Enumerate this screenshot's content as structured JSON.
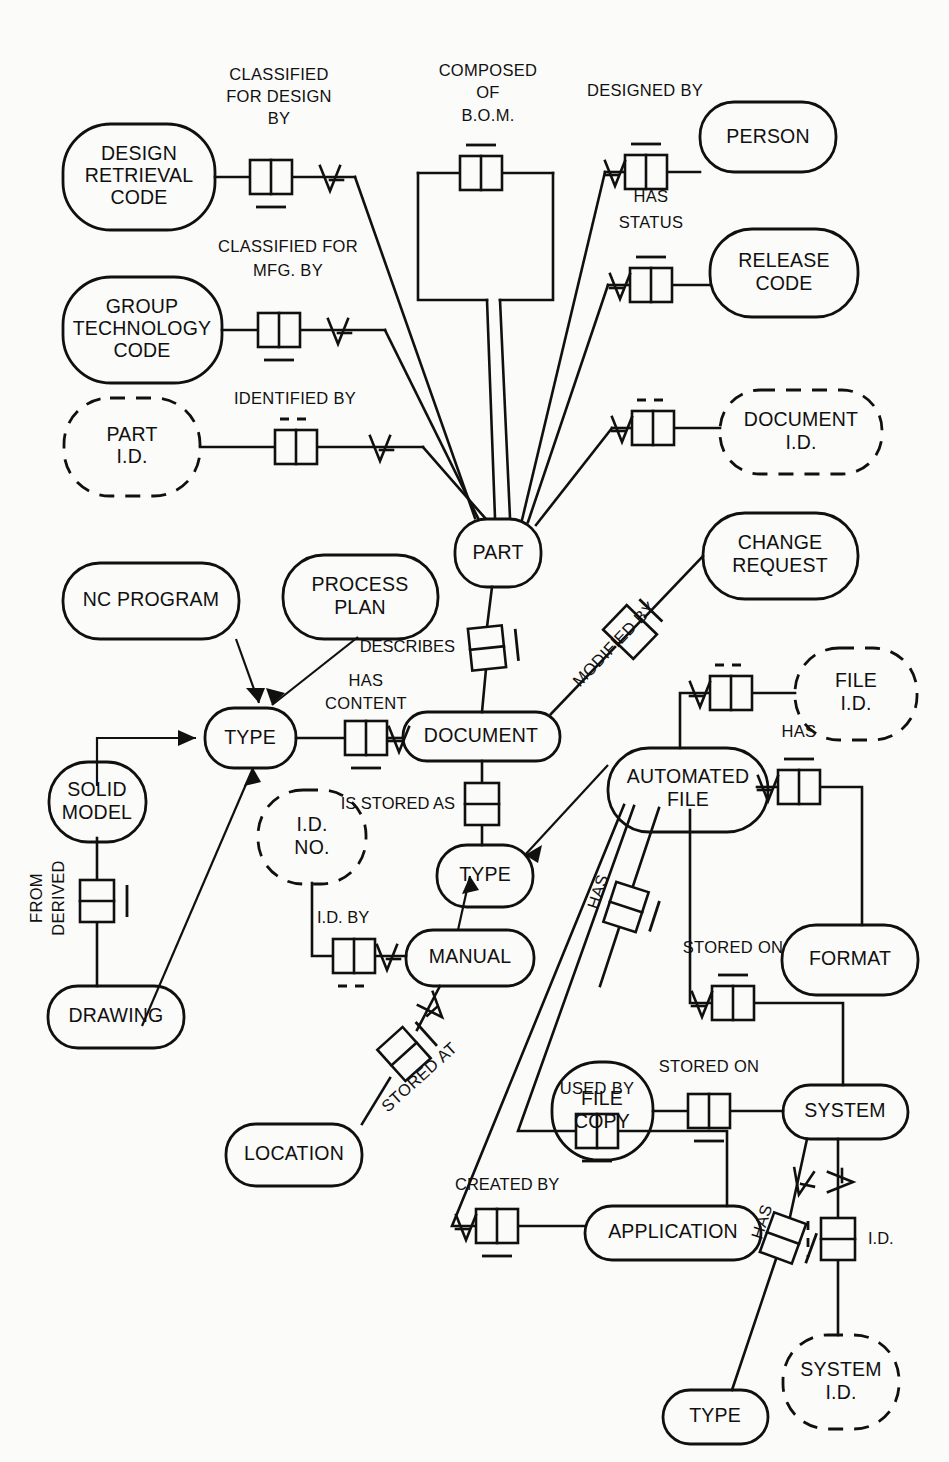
{
  "diagram": {
    "type": "entity-relationship",
    "notation": "IDEF1X-style information model",
    "background_color": "#fbfbf9",
    "line_color": "#101010"
  },
  "entities": [
    {
      "id": "design_retrieval_code",
      "label_lines": [
        "DESIGN",
        "RETRIEVAL",
        "CODE"
      ],
      "style": "solid"
    },
    {
      "id": "group_technology_code",
      "label_lines": [
        "GROUP",
        "TECHNOLOGY",
        "CODE"
      ],
      "style": "solid"
    },
    {
      "id": "part_id",
      "label_lines": [
        "PART",
        "I.D."
      ],
      "style": "dashed"
    },
    {
      "id": "person",
      "label_lines": [
        "PERSON"
      ],
      "style": "solid"
    },
    {
      "id": "release_code",
      "label_lines": [
        "RELEASE",
        "CODE"
      ],
      "style": "solid"
    },
    {
      "id": "document_id",
      "label_lines": [
        "DOCUMENT",
        "I.D."
      ],
      "style": "dashed"
    },
    {
      "id": "change_request",
      "label_lines": [
        "CHANGE",
        "REQUEST"
      ],
      "style": "solid"
    },
    {
      "id": "part",
      "label_lines": [
        "PART"
      ],
      "style": "solid"
    },
    {
      "id": "nc_program",
      "label_lines": [
        "NC PROGRAM"
      ],
      "style": "solid"
    },
    {
      "id": "process_plan",
      "label_lines": [
        "PROCESS",
        "PLAN"
      ],
      "style": "solid"
    },
    {
      "id": "type_left",
      "label_lines": [
        "TYPE"
      ],
      "style": "solid"
    },
    {
      "id": "document",
      "label_lines": [
        "DOCUMENT"
      ],
      "style": "solid"
    },
    {
      "id": "solid_model",
      "label_lines": [
        "SOLID",
        "MODEL"
      ],
      "style": "solid"
    },
    {
      "id": "drawing",
      "label_lines": [
        "DRAWING"
      ],
      "style": "solid"
    },
    {
      "id": "id_no",
      "label_lines": [
        "I.D.",
        "NO."
      ],
      "style": "dashed"
    },
    {
      "id": "type_doc",
      "label_lines": [
        "TYPE"
      ],
      "style": "solid"
    },
    {
      "id": "manual",
      "label_lines": [
        "MANUAL"
      ],
      "style": "solid"
    },
    {
      "id": "location",
      "label_lines": [
        "LOCATION"
      ],
      "style": "solid"
    },
    {
      "id": "file_id",
      "label_lines": [
        "FILE",
        "I.D."
      ],
      "style": "dashed"
    },
    {
      "id": "automated_file",
      "label_lines": [
        "AUTOMATED",
        "FILE"
      ],
      "style": "solid"
    },
    {
      "id": "format",
      "label_lines": [
        "FORMAT"
      ],
      "style": "solid"
    },
    {
      "id": "file_copy",
      "label_lines": [
        "FILE",
        "COPY"
      ],
      "style": "solid"
    },
    {
      "id": "system",
      "label_lines": [
        "SYSTEM"
      ],
      "style": "solid"
    },
    {
      "id": "application",
      "label_lines": [
        "APPLICATION"
      ],
      "style": "solid"
    },
    {
      "id": "system_id",
      "label_lines": [
        "SYSTEM",
        "I.D."
      ],
      "style": "dashed"
    },
    {
      "id": "type_system",
      "label_lines": [
        "TYPE"
      ],
      "style": "solid"
    }
  ],
  "relationships": [
    {
      "id": "classified_for_design_by",
      "label_lines": [
        "CLASSIFIED",
        "FOR DESIGN",
        "BY"
      ],
      "from": "design_retrieval_code",
      "to": "part"
    },
    {
      "id": "composed_of_bom",
      "label_lines": [
        "COMPOSED",
        "OF",
        "B.O.M."
      ],
      "from": "part",
      "to": "part"
    },
    {
      "id": "designed_by",
      "label_lines": [
        "DESIGNED BY"
      ],
      "from": "part",
      "to": "person"
    },
    {
      "id": "has_status",
      "label_lines": [
        "HAS",
        "STATUS"
      ],
      "from": "part",
      "to": "release_code"
    },
    {
      "id": "classified_for_mfg_by",
      "label_lines": [
        "CLASSIFIED FOR",
        "MFG. BY"
      ],
      "from": "group_technology_code",
      "to": "part"
    },
    {
      "id": "identified_by",
      "label_lines": [
        "IDENTIFIED BY"
      ],
      "from": "part_id",
      "to": "part"
    },
    {
      "id": "document_id_rel",
      "label_lines": [],
      "from": "part",
      "to": "document_id"
    },
    {
      "id": "modified_by",
      "label_lines": [
        "MODIFIED BY"
      ],
      "from": "document",
      "to": "change_request"
    },
    {
      "id": "describes",
      "label_lines": [
        "DESCRIBES"
      ],
      "from": "document",
      "to": "part"
    },
    {
      "id": "has_content",
      "label_lines": [
        "HAS",
        "CONTENT"
      ],
      "from": "type_left",
      "to": "document"
    },
    {
      "id": "is_stored_as",
      "label_lines": [
        "IS STORED AS"
      ],
      "from": "document",
      "to": "type_doc"
    },
    {
      "id": "derived_from",
      "label_lines": [
        "DERIVED",
        "FROM"
      ],
      "from": "solid_model",
      "to": "drawing"
    },
    {
      "id": "id_by",
      "label_lines": [
        "I.D. BY"
      ],
      "from": "id_no",
      "to": "manual"
    },
    {
      "id": "stored_at",
      "label_lines": [
        "STORED AT"
      ],
      "from": "manual",
      "to": "location"
    },
    {
      "id": "file_id_rel",
      "label_lines": [],
      "from": "automated_file",
      "to": "file_id"
    },
    {
      "id": "has_format",
      "label_lines": [
        "HAS"
      ],
      "from": "automated_file",
      "to": "format"
    },
    {
      "id": "stored_on_af",
      "label_lines": [
        "STORED ON"
      ],
      "from": "automated_file",
      "to": "system"
    },
    {
      "id": "has_file_copy",
      "label_lines": [
        "HAS"
      ],
      "from": "automated_file",
      "to": "file_copy"
    },
    {
      "id": "stored_on_fc",
      "label_lines": [
        "STORED ON"
      ],
      "from": "file_copy",
      "to": "system"
    },
    {
      "id": "used_by",
      "label_lines": [
        "USED BY"
      ],
      "from": "automated_file",
      "to": "application"
    },
    {
      "id": "created_by",
      "label_lines": [
        "CREATED BY"
      ],
      "from": "automated_file",
      "to": "application"
    },
    {
      "id": "has_type_system",
      "label_lines": [
        "HAS"
      ],
      "from": "system",
      "to": "type_system"
    },
    {
      "id": "system_id_rel",
      "label_lines": [
        "I.D."
      ],
      "from": "system",
      "to": "system_id"
    }
  ],
  "relationship_labels": {
    "classified_for_design_by_1": "CLASSIFIED",
    "classified_for_design_by_2": "FOR DESIGN",
    "classified_for_design_by_3": "BY",
    "composed_of_1": "COMPOSED",
    "composed_of_2": "OF",
    "composed_of_3": "B.O.M.",
    "designed_by": "DESIGNED BY",
    "has_status_1": "HAS",
    "has_status_2": "STATUS",
    "classified_for_mfg_1": "CLASSIFIED FOR",
    "classified_for_mfg_2": "MFG. BY",
    "identified_by": "IDENTIFIED BY",
    "modified_by": "MODIFIED BY",
    "describes": "DESCRIBES",
    "has_content_1": "HAS",
    "has_content_2": "CONTENT",
    "is_stored_as": "IS STORED AS",
    "derived_1": "DERIVED",
    "derived_2": "FROM",
    "id_by": "I.D. BY",
    "stored_at": "STORED AT",
    "has_format": "HAS",
    "stored_on_af": "STORED ON",
    "has_file_copy": "HAS",
    "stored_on_fc": "STORED ON",
    "used_by": "USED BY",
    "created_by": "CREATED BY",
    "has_type_system": "HAS",
    "system_id_label": "I.D."
  },
  "entity_labels": {
    "design_retrieval_code_1": "DESIGN",
    "design_retrieval_code_2": "RETRIEVAL",
    "design_retrieval_code_3": "CODE",
    "group_technology_code_1": "GROUP",
    "group_technology_code_2": "TECHNOLOGY",
    "group_technology_code_3": "CODE",
    "part_id_1": "PART",
    "part_id_2": "I.D.",
    "person": "PERSON",
    "release_code_1": "RELEASE",
    "release_code_2": "CODE",
    "document_id_1": "DOCUMENT",
    "document_id_2": "I.D.",
    "change_request_1": "CHANGE",
    "change_request_2": "REQUEST",
    "part": "PART",
    "nc_program": "NC PROGRAM",
    "process_plan_1": "PROCESS",
    "process_plan_2": "PLAN",
    "type_left": "TYPE",
    "document": "DOCUMENT",
    "solid_model_1": "SOLID",
    "solid_model_2": "MODEL",
    "drawing": "DRAWING",
    "id_no_1": "I.D.",
    "id_no_2": "NO.",
    "type_doc": "TYPE",
    "manual": "MANUAL",
    "location": "LOCATION",
    "file_id_1": "FILE",
    "file_id_2": "I.D.",
    "automated_file_1": "AUTOMATED",
    "automated_file_2": "FILE",
    "format": "FORMAT",
    "file_copy_1": "FILE",
    "file_copy_2": "COPY",
    "system": "SYSTEM",
    "application": "APPLICATION",
    "system_id_1": "SYSTEM",
    "system_id_2": "I.D.",
    "type_system": "TYPE"
  }
}
